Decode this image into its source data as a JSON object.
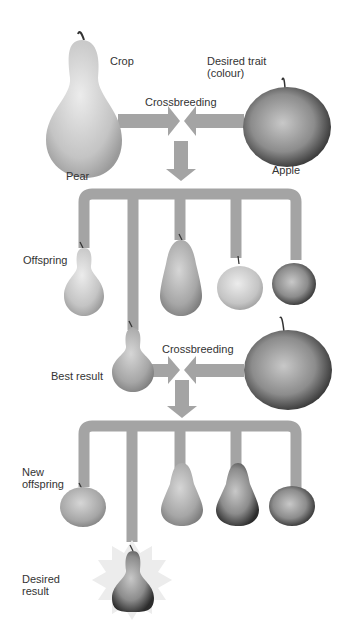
{
  "labels": {
    "crop": "Crop",
    "desired_trait": "Desired trait\n(colour)",
    "crossbreeding_1": "Crossbreeding",
    "pear": "Pear",
    "apple": "Apple",
    "offspring": "Offspring",
    "crossbreeding_2": "Crossbreeding",
    "best_result": "Best result",
    "new_offspring": "New\noffspring",
    "desired_result": "Desired\nresult"
  },
  "colors": {
    "pipe": "#a4a4a4",
    "background": "#ffffff",
    "text": "#333333"
  }
}
